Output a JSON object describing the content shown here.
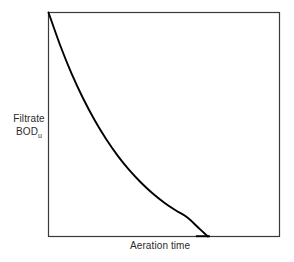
{
  "figure": {
    "background_color": "#ffffff",
    "frame_color": "#3a3a3a",
    "curve_color": "#000000"
  },
  "axes": {
    "y_label_line1": "Filtrate",
    "y_label_line2": "BOD",
    "y_label_subscript": "u",
    "x_label": "Aeration time"
  },
  "chart_data": {
    "type": "line",
    "title": "",
    "xlabel": "Aeration time",
    "ylabel": "Filtrate BODu",
    "grid": false,
    "legend": null,
    "axis_ticks": {
      "x": [],
      "y": []
    },
    "xlim": [
      0,
      1
    ],
    "ylim": [
      0,
      1
    ],
    "series": [
      {
        "name": "Filtrate BODu vs aeration time",
        "description": "Exponential decay from maximum at zero aeration time, flattening to near zero and merging with the baseline at roughly 69% of the plotted x-range",
        "x": [
          0.0,
          0.05,
          0.1,
          0.15,
          0.2,
          0.25,
          0.3,
          0.35,
          0.4,
          0.45,
          0.5,
          0.55,
          0.6,
          0.65,
          0.69
        ],
        "y": [
          1.0,
          0.855,
          0.727,
          0.616,
          0.519,
          0.434,
          0.36,
          0.296,
          0.241,
          0.193,
          0.152,
          0.117,
          0.086,
          0.038,
          0.0
        ]
      }
    ]
  }
}
